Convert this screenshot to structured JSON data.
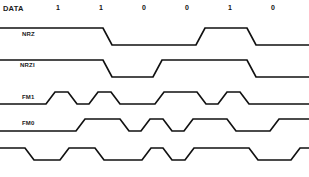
{
  "diagram": {
    "title_label": "DATA",
    "bits": [
      "1",
      "1",
      "0",
      "0",
      "1",
      "0"
    ],
    "row_labels": {
      "nrz": "NRZ",
      "nrzi": "NRZI",
      "fm1": "FM1",
      "fm0": "FM0",
      "fifth": ""
    },
    "stroke_color": "#111111",
    "background_color": "#ffffff",
    "geometry": {
      "bit_count": 6,
      "cell_width": 43,
      "first_cell_left": 58,
      "slew": 6
    },
    "waveforms": {
      "nrz": {
        "levels_per_bit": [
          "high",
          "high",
          "low",
          "low",
          "high",
          "low"
        ]
      },
      "nrzi": {
        "levels_per_bit": [
          "high",
          "high",
          "low",
          "high",
          "high",
          "low"
        ]
      },
      "fm1": {
        "half_cells": [
          "high",
          "low",
          "high",
          "low",
          "high",
          "high",
          "low",
          "high",
          "low",
          "low",
          "high",
          "low"
        ]
      },
      "fm0": {
        "half_cells": [
          "low",
          "high",
          "high",
          "low",
          "high",
          "low",
          "low",
          "high",
          "high",
          "low",
          "high",
          "low"
        ]
      },
      "fifth": {
        "half_cells": [
          "high",
          "low",
          "low",
          "high",
          "high",
          "low",
          "high",
          "low",
          "high",
          "high",
          "low",
          "high"
        ]
      }
    },
    "points": {
      "nrz": "0,28 103,28 112,45 196,45 205,28 247,28 256,45 309,45",
      "nrzi": "0,60 103,60 112,77 153,77 162,60 247,60 256,77 309,77",
      "fm1": "0,104 46,104 55,92 68,92 77,104 89,104 98,92 111,92 120,104 155,104 164,92 197,92 206,104 218,104 227,92 240,92 249,104 309,104",
      "fm0": "0,131 76,131 85,119 120,119 129,131 141,131 150,119 163,119 172,131 184,131 193,119 227,119 236,131 270,131 279,119 309,119",
      "fifth": "0,148 25,148 34,160 60,160 69,148 95,148 104,160 142,160 151,148 163,148 172,160 185,160 194,148 249,148 258,160 291,160 300,148 309,148"
    }
  }
}
